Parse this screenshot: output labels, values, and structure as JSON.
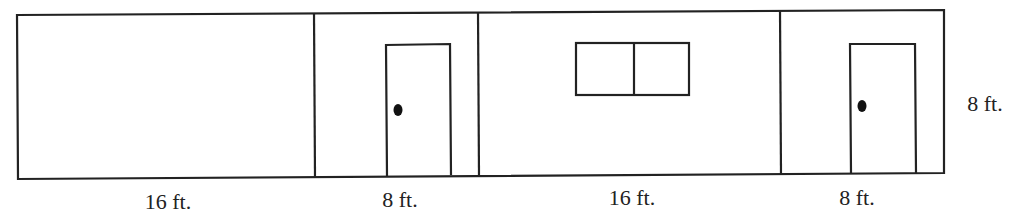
{
  "diagram": {
    "title": "",
    "colors": {
      "line": "#222222",
      "background": "#ffffff"
    },
    "panels": [
      {
        "id": "panel-1",
        "width_label": "16 ft.",
        "feature": "none"
      },
      {
        "id": "panel-2",
        "width_label": "8 ft.",
        "feature": "door"
      },
      {
        "id": "panel-3",
        "width_label": "16 ft.",
        "feature": "window"
      },
      {
        "id": "panel-4",
        "width_label": "8 ft.",
        "feature": "door"
      }
    ],
    "height_label": "8 ft."
  }
}
